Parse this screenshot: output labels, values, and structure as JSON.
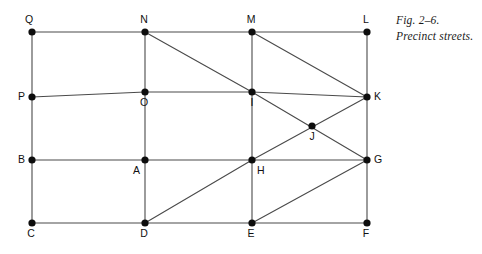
{
  "figure": {
    "caption_line1": "Fig. 2–6.",
    "caption_line2": "Precinct streets.",
    "stroke_color": "#4a4a4a",
    "node_color": "#0d0d0d",
    "background_color": "#ffffff"
  },
  "chart_data": {
    "type": "diagram",
    "title": "Precinct streets.",
    "subtitle": "Fig. 2–6.",
    "nodes": [
      {
        "id": "Q",
        "label": "Q",
        "x": 32,
        "y": 32,
        "label_dx": -3,
        "label_dy": -9,
        "label_anchor": "middle"
      },
      {
        "id": "N",
        "label": "N",
        "x": 145,
        "y": 32,
        "label_dx": -1,
        "label_dy": -9,
        "label_anchor": "middle"
      },
      {
        "id": "M",
        "label": "M",
        "x": 252,
        "y": 32,
        "label_dx": -1,
        "label_dy": -9,
        "label_anchor": "middle"
      },
      {
        "id": "L",
        "label": "L",
        "x": 367,
        "y": 32,
        "label_dx": -1,
        "label_dy": -9,
        "label_anchor": "middle"
      },
      {
        "id": "P",
        "label": "P",
        "x": 32,
        "y": 97,
        "label_dx": -7,
        "label_dy": 3,
        "label_anchor": "end"
      },
      {
        "id": "O",
        "label": "O",
        "x": 145,
        "y": 92,
        "label_dx": -1,
        "label_dy": 14,
        "label_anchor": "middle"
      },
      {
        "id": "I",
        "label": "I",
        "x": 252,
        "y": 92,
        "label_dx": 0,
        "label_dy": 14,
        "label_anchor": "middle"
      },
      {
        "id": "K",
        "label": "K",
        "x": 367,
        "y": 97,
        "label_dx": 7,
        "label_dy": 3,
        "label_anchor": "start"
      },
      {
        "id": "J",
        "label": "J",
        "x": 312,
        "y": 126,
        "label_dx": 0,
        "label_dy": 14,
        "label_anchor": "middle"
      },
      {
        "id": "B",
        "label": "B",
        "x": 32,
        "y": 160,
        "label_dx": -7,
        "label_dy": 3,
        "label_anchor": "end"
      },
      {
        "id": "A",
        "label": "A",
        "x": 145,
        "y": 160,
        "label_dx": -5,
        "label_dy": 14,
        "label_anchor": "end"
      },
      {
        "id": "H",
        "label": "H",
        "x": 252,
        "y": 160,
        "label_dx": 5,
        "label_dy": 14,
        "label_anchor": "start"
      },
      {
        "id": "G",
        "label": "G",
        "x": 367,
        "y": 160,
        "label_dx": 7,
        "label_dy": 3,
        "label_anchor": "start"
      },
      {
        "id": "C",
        "label": "C",
        "x": 32,
        "y": 223,
        "label_dx": -1,
        "label_dy": 14,
        "label_anchor": "middle"
      },
      {
        "id": "D",
        "label": "D",
        "x": 145,
        "y": 223,
        "label_dx": -1,
        "label_dy": 14,
        "label_anchor": "middle"
      },
      {
        "id": "E",
        "label": "E",
        "x": 252,
        "y": 223,
        "label_dx": -1,
        "label_dy": 14,
        "label_anchor": "middle"
      },
      {
        "id": "F",
        "label": "F",
        "x": 367,
        "y": 223,
        "label_dx": -1,
        "label_dy": 14,
        "label_anchor": "middle"
      }
    ],
    "edges": [
      {
        "from": "Q",
        "to": "N"
      },
      {
        "from": "N",
        "to": "M"
      },
      {
        "from": "M",
        "to": "L"
      },
      {
        "from": "P",
        "to": "O"
      },
      {
        "from": "O",
        "to": "I"
      },
      {
        "from": "I",
        "to": "K"
      },
      {
        "from": "B",
        "to": "A"
      },
      {
        "from": "A",
        "to": "H"
      },
      {
        "from": "H",
        "to": "G"
      },
      {
        "from": "C",
        "to": "D"
      },
      {
        "from": "D",
        "to": "E"
      },
      {
        "from": "E",
        "to": "F"
      },
      {
        "from": "Q",
        "to": "P"
      },
      {
        "from": "P",
        "to": "B"
      },
      {
        "from": "B",
        "to": "C"
      },
      {
        "from": "N",
        "to": "O"
      },
      {
        "from": "O",
        "to": "A"
      },
      {
        "from": "A",
        "to": "D"
      },
      {
        "from": "M",
        "to": "I"
      },
      {
        "from": "I",
        "to": "H"
      },
      {
        "from": "H",
        "to": "E"
      },
      {
        "from": "L",
        "to": "K"
      },
      {
        "from": "K",
        "to": "G"
      },
      {
        "from": "G",
        "to": "F"
      },
      {
        "from": "N",
        "to": "I"
      },
      {
        "from": "M",
        "to": "K"
      },
      {
        "from": "I",
        "to": "G"
      },
      {
        "from": "H",
        "to": "K"
      },
      {
        "from": "D",
        "to": "H"
      },
      {
        "from": "E",
        "to": "G"
      }
    ],
    "node_radius": 3.6
  }
}
